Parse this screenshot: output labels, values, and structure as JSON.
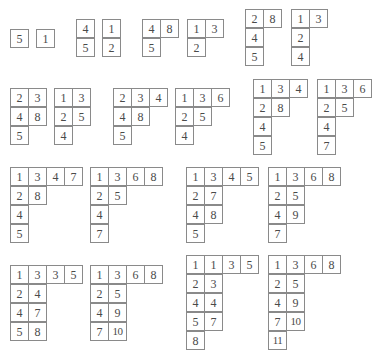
{
  "diagram": {
    "title": "",
    "tableaux": [
      {
        "id": "t1",
        "x": 10,
        "y": 29,
        "rows": [
          [
            "5"
          ]
        ]
      },
      {
        "id": "t2",
        "x": 36,
        "y": 29,
        "rows": [
          [
            "1"
          ]
        ]
      },
      {
        "id": "t3",
        "x": 76,
        "y": 19,
        "rows": [
          [
            "4"
          ],
          [
            "5"
          ]
        ]
      },
      {
        "id": "t4",
        "x": 102,
        "y": 19,
        "rows": [
          [
            "1"
          ],
          [
            "2"
          ]
        ]
      },
      {
        "id": "t5",
        "x": 142,
        "y": 19,
        "rows": [
          [
            "4",
            "8"
          ],
          [
            "5"
          ]
        ]
      },
      {
        "id": "t6",
        "x": 187,
        "y": 19,
        "rows": [
          [
            "1",
            "3"
          ],
          [
            "2"
          ]
        ]
      },
      {
        "id": "t7",
        "x": 245,
        "y": 9,
        "rows": [
          [
            "2",
            "8"
          ],
          [
            "4"
          ],
          [
            "5"
          ]
        ]
      },
      {
        "id": "t8",
        "x": 291,
        "y": 9,
        "rows": [
          [
            "1",
            "3"
          ],
          [
            "2"
          ],
          [
            "4"
          ]
        ]
      },
      {
        "id": "t9",
        "x": 10,
        "y": 88,
        "rows": [
          [
            "2",
            "3"
          ],
          [
            "4",
            "8"
          ],
          [
            "5"
          ]
        ]
      },
      {
        "id": "t10",
        "x": 54,
        "y": 88,
        "rows": [
          [
            "1",
            "3"
          ],
          [
            "2",
            "5"
          ],
          [
            "4"
          ]
        ]
      },
      {
        "id": "t11",
        "x": 113,
        "y": 88,
        "rows": [
          [
            "2",
            "3",
            "4"
          ],
          [
            "4",
            "8"
          ],
          [
            "5"
          ]
        ]
      },
      {
        "id": "t12",
        "x": 175,
        "y": 88,
        "rows": [
          [
            "1",
            "3",
            "6"
          ],
          [
            "2",
            "5"
          ],
          [
            "4"
          ]
        ]
      },
      {
        "id": "t13",
        "x": 253,
        "y": 79,
        "rows": [
          [
            "1",
            "3",
            "4"
          ],
          [
            "2",
            "8"
          ],
          [
            "4"
          ],
          [
            "5"
          ]
        ]
      },
      {
        "id": "t14",
        "x": 317,
        "y": 79,
        "rows": [
          [
            "1",
            "3",
            "6"
          ],
          [
            "2",
            "5"
          ],
          [
            "4"
          ],
          [
            "7"
          ]
        ]
      },
      {
        "id": "t15",
        "x": 10,
        "y": 167,
        "rows": [
          [
            "1",
            "3",
            "4",
            "7"
          ],
          [
            "2",
            "8"
          ],
          [
            "4"
          ],
          [
            "5"
          ]
        ]
      },
      {
        "id": "t16",
        "x": 90,
        "y": 167,
        "rows": [
          [
            "1",
            "3",
            "6",
            "8"
          ],
          [
            "2",
            "5"
          ],
          [
            "4"
          ],
          [
            "7"
          ]
        ]
      },
      {
        "id": "t17",
        "x": 186,
        "y": 167,
        "rows": [
          [
            "1",
            "3",
            "4",
            "5"
          ],
          [
            "2",
            "7"
          ],
          [
            "4",
            "8"
          ],
          [
            "5"
          ]
        ]
      },
      {
        "id": "t18",
        "x": 268,
        "y": 167,
        "rows": [
          [
            "1",
            "3",
            "6",
            "8"
          ],
          [
            "2",
            "5"
          ],
          [
            "4",
            "9"
          ],
          [
            "7"
          ]
        ]
      },
      {
        "id": "t19",
        "x": 10,
        "y": 265,
        "rows": [
          [
            "1",
            "3",
            "3",
            "5"
          ],
          [
            "2",
            "4"
          ],
          [
            "4",
            "7"
          ],
          [
            "5",
            "8"
          ]
        ]
      },
      {
        "id": "t20",
        "x": 90,
        "y": 265,
        "rows": [
          [
            "1",
            "3",
            "6",
            "8"
          ],
          [
            "2",
            "5"
          ],
          [
            "4",
            "9"
          ],
          [
            "7",
            "10"
          ]
        ]
      },
      {
        "id": "t21",
        "x": 186,
        "y": 255,
        "rows": [
          [
            "1",
            "1",
            "3",
            "5"
          ],
          [
            "2",
            "3"
          ],
          [
            "4",
            "4"
          ],
          [
            "5",
            "7"
          ],
          [
            "8"
          ]
        ]
      },
      {
        "id": "t22",
        "x": 268,
        "y": 255,
        "rows": [
          [
            "1",
            "3",
            "6",
            "8"
          ],
          [
            "2",
            "5"
          ],
          [
            "4",
            "9"
          ],
          [
            "7",
            "10"
          ],
          [
            "11"
          ]
        ]
      }
    ]
  },
  "style": {
    "border_color": "#8a8a8a",
    "text_color": "#4a4a4a",
    "background": "#ffffff"
  }
}
